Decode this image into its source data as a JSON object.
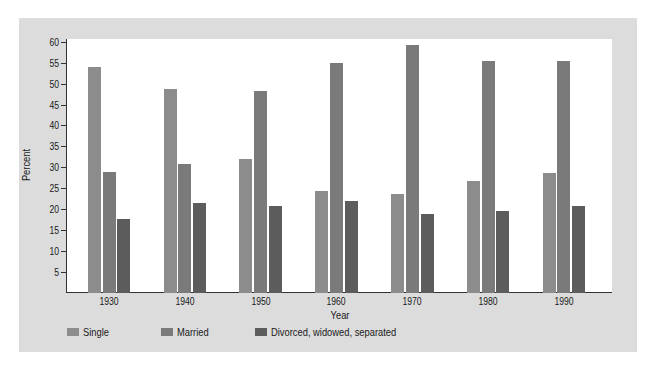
{
  "chart_data": {
    "type": "bar",
    "title": "",
    "xlabel": "Year",
    "ylabel": "Percent",
    "ylim": [
      0,
      60
    ],
    "yticks": [
      5,
      10,
      15,
      20,
      25,
      30,
      35,
      40,
      45,
      50,
      55,
      60
    ],
    "grid": false,
    "legend_position": "bottom-left",
    "categories": [
      "1930",
      "1940",
      "1950",
      "1960",
      "1970",
      "1980",
      "1990"
    ],
    "series": [
      {
        "name": "Single",
        "color": "#8c8c8c",
        "values": [
          54,
          48.7,
          32,
          24.4,
          23.6,
          26.8,
          28.7
        ]
      },
      {
        "name": "Married",
        "color": "#7a7a7a",
        "values": [
          29,
          30.7,
          48.3,
          54.9,
          59.2,
          55.4,
          55.3
        ]
      },
      {
        "name": "Divorced, widowed, separated",
        "color": "#5c5c5c",
        "values": [
          17.6,
          21.5,
          20.8,
          22,
          18.9,
          19.6,
          20.8
        ]
      }
    ]
  },
  "axes": {
    "y_title": "Percent",
    "x_title": "Year"
  },
  "legend": [
    {
      "label": "Single",
      "color": "#8c8c8c"
    },
    {
      "label": "Married",
      "color": "#7a7a7a"
    },
    {
      "label": "Divorced, widowed, separated",
      "color": "#5c5c5c"
    }
  ]
}
